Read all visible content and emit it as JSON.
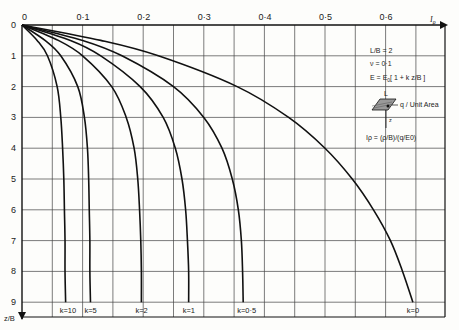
{
  "chart_data": {
    "type": "line",
    "title": "",
    "xlabel": "Iρ",
    "ylabel": "z/B",
    "xlim": [
      0,
      0.7
    ],
    "ylim": [
      0,
      9
    ],
    "x_ticks": [
      "0",
      "0·1",
      "0·2",
      "0·3",
      "0·4",
      "0·5",
      "0·6"
    ],
    "y_ticks": [
      "0",
      "1",
      "2",
      "3",
      "4",
      "5",
      "6",
      "7",
      "8",
      "9"
    ],
    "grid": true,
    "x_grid_step": 0.05,
    "y_grid_step": 1,
    "y_axis_inverted": true,
    "legend_position": "upper-right (annotation box)",
    "annotations": {
      "lines": [
        "L/B = 2",
        "ν = 0·1",
        "E = E0 [1 + k z/B]",
        "q / Unit Area",
        "Iρ = (ρ/B)/(q/E0)"
      ],
      "diagram_labels": [
        "L",
        "z"
      ]
    },
    "series": [
      {
        "name": "k = 10",
        "label": "k=10",
        "z": [
          0,
          0.5,
          1,
          2,
          3,
          4,
          5,
          6,
          7,
          8,
          9
        ],
        "I": [
          0,
          0.025,
          0.042,
          0.058,
          0.064,
          0.067,
          0.069,
          0.07,
          0.071,
          0.071,
          0.072
        ]
      },
      {
        "name": "k = 5",
        "label": "k=5",
        "z": [
          0,
          0.5,
          1,
          2,
          3,
          4,
          5,
          6,
          7,
          8,
          9
        ],
        "I": [
          0,
          0.038,
          0.064,
          0.092,
          0.103,
          0.108,
          0.11,
          0.111,
          0.112,
          0.112,
          0.113
        ]
      },
      {
        "name": "k = 2",
        "label": "k=2",
        "z": [
          0,
          0.5,
          1,
          2,
          3,
          4,
          5,
          6,
          7,
          8,
          9
        ],
        "I": [
          0,
          0.06,
          0.1,
          0.148,
          0.172,
          0.185,
          0.191,
          0.194,
          0.196,
          0.197,
          0.197
        ]
      },
      {
        "name": "k = 1",
        "label": "k=1",
        "z": [
          0,
          0.5,
          1,
          2,
          3,
          4,
          5,
          6,
          7,
          8,
          9
        ],
        "I": [
          0,
          0.08,
          0.13,
          0.195,
          0.233,
          0.253,
          0.264,
          0.27,
          0.273,
          0.275,
          0.275
        ]
      },
      {
        "name": "k = 0.5",
        "label": "k=0·5",
        "z": [
          0,
          0.5,
          1,
          2,
          3,
          4,
          5,
          6,
          7,
          8,
          9
        ],
        "I": [
          0,
          0.1,
          0.165,
          0.25,
          0.3,
          0.33,
          0.347,
          0.357,
          0.362,
          0.364,
          0.365
        ]
      },
      {
        "name": "k = 0",
        "label": "k=0",
        "z": [
          0,
          0.5,
          1,
          2,
          3,
          4,
          5,
          6,
          7,
          8,
          9
        ],
        "I": [
          0,
          0.13,
          0.225,
          0.355,
          0.44,
          0.5,
          0.545,
          0.58,
          0.608,
          0.628,
          0.645
        ]
      }
    ]
  },
  "figure": {
    "x_axis_title": "I",
    "x_axis_sub": "ρ",
    "y_axis_title": "z/B",
    "origin_label": "0",
    "legend": {
      "line1": "L/B = 2",
      "line2": "ν = 0·1",
      "line3_pre": "E = E",
      "line3_sub": "0",
      "line3_post": "[ 1 + k z/B ]",
      "load_label": "q / Unit Area",
      "L_label": "L",
      "z_label": "z",
      "formula": "Iρ = (ρ/B)/(q/E0)"
    },
    "colors": {
      "curve": "#111111",
      "grid": "#444444",
      "background": "#fdfdfb"
    }
  }
}
